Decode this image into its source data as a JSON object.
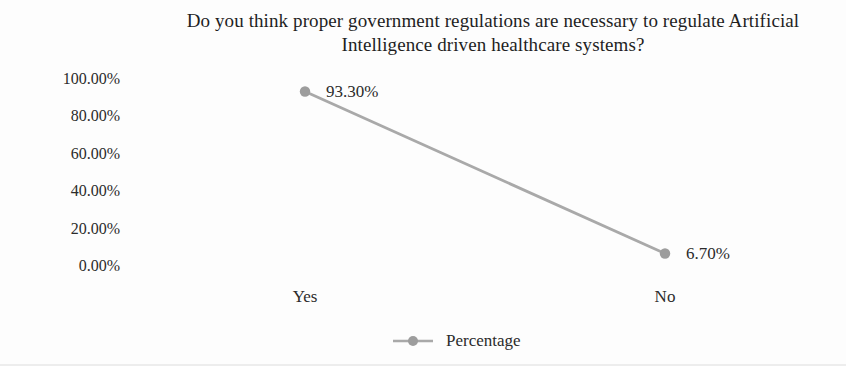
{
  "page": {
    "background": "#fdfdfd",
    "text_color": "#2b2b2b"
  },
  "title": {
    "line1": "Do you think proper government regulations are necessary to regulate Artificial",
    "line2": "Intelligence driven healthcare systems?"
  },
  "chart_data": {
    "type": "line",
    "title": "Do you think proper government regulations are necessary to regulate Artificial Intelligence driven healthcare systems?",
    "categories": [
      "Yes",
      "No"
    ],
    "series": [
      {
        "name": "Percentage",
        "values": [
          93.3,
          6.7
        ],
        "data_labels": [
          "93.30%",
          "6.70%"
        ],
        "line_color": "#a9a9a9",
        "marker_color": "#9d9d9d"
      }
    ],
    "xlabel": "",
    "ylabel": "",
    "ylim": [
      0,
      100
    ],
    "yticks_top_to_bottom": [
      "100.00%",
      "80.00%",
      "60.00%",
      "40.00%",
      "20.00%",
      "0.00%"
    ],
    "grid": false,
    "axis_lines": false,
    "legend_position": "bottom-center",
    "legend_label": "Percentage"
  }
}
